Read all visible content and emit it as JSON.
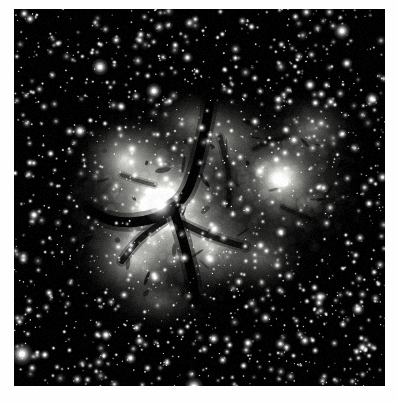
{
  "page": {
    "background_color": "#fefefe",
    "margin_caption": ""
  },
  "plate": {
    "name": "Trifid Nebula plate",
    "object_name": "Trifid Nebula (M20)",
    "rendering": "grayscale astronomical photograph",
    "frame": {
      "x": 14,
      "y": 9,
      "width": 371,
      "height": 377
    },
    "background_color": "#000000",
    "nebula_color": "#f2f2ee",
    "dust_lane_color": "#0a0a0a",
    "star_color": "#ffffff"
  },
  "chart_data": {
    "type": "heatmap",
    "xlabel": "",
    "ylabel": "",
    "colormap": "grayscale",
    "value_range": [
      0,
      255
    ],
    "width": 371,
    "height": 377,
    "nebula_blobs": [
      {
        "cx": 150,
        "cy": 195,
        "rx": 105,
        "ry": 100,
        "intensity": 0.72,
        "blur": 34
      },
      {
        "cx": 148,
        "cy": 200,
        "rx": 66,
        "ry": 66,
        "intensity": 0.84,
        "blur": 24
      },
      {
        "cx": 146,
        "cy": 198,
        "rx": 30,
        "ry": 28,
        "intensity": 1.0,
        "blur": 12
      },
      {
        "cx": 112,
        "cy": 150,
        "rx": 52,
        "ry": 46,
        "intensity": 0.78,
        "blur": 22
      },
      {
        "cx": 120,
        "cy": 250,
        "rx": 60,
        "ry": 52,
        "intensity": 0.74,
        "blur": 24
      },
      {
        "cx": 196,
        "cy": 238,
        "rx": 56,
        "ry": 54,
        "intensity": 0.7,
        "blur": 24
      },
      {
        "cx": 212,
        "cy": 130,
        "rx": 52,
        "ry": 48,
        "intensity": 0.52,
        "blur": 26
      },
      {
        "cx": 268,
        "cy": 172,
        "rx": 78,
        "ry": 74,
        "intensity": 0.6,
        "blur": 30
      },
      {
        "cx": 266,
        "cy": 168,
        "rx": 40,
        "ry": 38,
        "intensity": 0.66,
        "blur": 18
      },
      {
        "cx": 300,
        "cy": 120,
        "rx": 46,
        "ry": 40,
        "intensity": 0.44,
        "blur": 24
      },
      {
        "cx": 246,
        "cy": 248,
        "rx": 50,
        "ry": 44,
        "intensity": 0.4,
        "blur": 26
      },
      {
        "cx": 178,
        "cy": 112,
        "rx": 48,
        "ry": 34,
        "intensity": 0.4,
        "blur": 24
      },
      {
        "cx": 146,
        "cy": 292,
        "rx": 54,
        "ry": 30,
        "intensity": 0.32,
        "blur": 26
      }
    ],
    "dust_lanes": [
      {
        "points": [
          [
            196,
            92
          ],
          [
            192,
            118
          ],
          [
            186,
            142
          ],
          [
            180,
            166
          ],
          [
            172,
            186
          ],
          [
            160,
            198
          ]
        ],
        "width": 9,
        "opacity": 0.95
      },
      {
        "points": [
          [
            160,
            198
          ],
          [
            150,
            206
          ],
          [
            132,
            212
          ],
          [
            110,
            214
          ],
          [
            90,
            210
          ],
          [
            74,
            200
          ]
        ],
        "width": 10,
        "opacity": 0.95
      },
      {
        "points": [
          [
            160,
            202
          ],
          [
            166,
            220
          ],
          [
            172,
            242
          ],
          [
            178,
            266
          ],
          [
            182,
            292
          ]
        ],
        "width": 9,
        "opacity": 0.95
      },
      {
        "points": [
          [
            150,
            212
          ],
          [
            132,
            224
          ],
          [
            118,
            238
          ],
          [
            108,
            252
          ]
        ],
        "width": 6,
        "opacity": 0.8
      },
      {
        "points": [
          [
            168,
            214
          ],
          [
            188,
            224
          ],
          [
            210,
            232
          ],
          [
            232,
            238
          ]
        ],
        "width": 6,
        "opacity": 0.75
      },
      {
        "points": [
          [
            206,
            128
          ],
          [
            212,
            150
          ],
          [
            216,
            174
          ],
          [
            214,
            196
          ]
        ],
        "width": 5,
        "opacity": 0.6
      },
      {
        "points": [
          [
            240,
            140
          ],
          [
            256,
            132
          ],
          [
            272,
            128
          ]
        ],
        "width": 4,
        "opacity": 0.5
      },
      {
        "points": [
          [
            268,
            198
          ],
          [
            286,
            206
          ],
          [
            302,
            212
          ]
        ],
        "width": 4,
        "opacity": 0.5
      },
      {
        "points": [
          [
            108,
            166
          ],
          [
            124,
            172
          ],
          [
            140,
            176
          ]
        ],
        "width": 4,
        "opacity": 0.45
      }
    ],
    "bright_stars": [
      {
        "x": 146,
        "y": 196,
        "r": 7.0,
        "peak": 1.0
      },
      {
        "x": 264,
        "y": 170,
        "r": 5.2,
        "peak": 1.0
      },
      {
        "x": 8,
        "y": 345,
        "r": 4.6,
        "peak": 1.0
      },
      {
        "x": 180,
        "y": 378,
        "r": 3.8,
        "peak": 1.0
      },
      {
        "x": 86,
        "y": 58,
        "r": 3.4,
        "peak": 1.0
      },
      {
        "x": 328,
        "y": 22,
        "r": 3.4,
        "peak": 1.0
      },
      {
        "x": 140,
        "y": 82,
        "r": 3.2,
        "peak": 1.0
      },
      {
        "x": 200,
        "y": 220,
        "r": 3.0,
        "peak": 1.0
      },
      {
        "x": 196,
        "y": 250,
        "r": 3.0,
        "peak": 1.0
      },
      {
        "x": 66,
        "y": 122,
        "r": 2.8,
        "peak": 1.0
      },
      {
        "x": 358,
        "y": 90,
        "r": 2.8,
        "peak": 1.0
      },
      {
        "x": 246,
        "y": 162,
        "r": 2.6,
        "peak": 1.0
      },
      {
        "x": 118,
        "y": 140,
        "r": 2.6,
        "peak": 1.0
      },
      {
        "x": 296,
        "y": 76,
        "r": 2.4,
        "peak": 1.0
      },
      {
        "x": 20,
        "y": 206,
        "r": 2.4,
        "peak": 1.0
      },
      {
        "x": 344,
        "y": 300,
        "r": 2.6,
        "peak": 1.0
      },
      {
        "x": 306,
        "y": 288,
        "r": 2.4,
        "peak": 1.0
      },
      {
        "x": 92,
        "y": 326,
        "r": 2.4,
        "peak": 1.0
      },
      {
        "x": 234,
        "y": 334,
        "r": 2.2,
        "peak": 1.0
      },
      {
        "x": 152,
        "y": 170,
        "r": 2.4,
        "peak": 1.0
      }
    ],
    "star_field": {
      "count": 1500,
      "seed": 20240520,
      "radius_range": [
        0.5,
        2.4
      ],
      "brightness_range": [
        0.25,
        1.0
      ]
    }
  }
}
